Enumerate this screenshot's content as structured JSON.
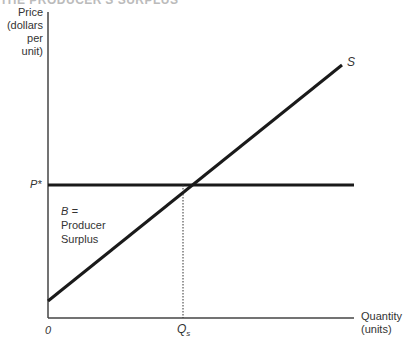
{
  "header_fragment": "THE PRODUCER'S SURPLUS",
  "axes": {
    "y_label_lines": [
      "Price",
      "(dollars",
      "per unit)"
    ],
    "x_label_lines": [
      "Quantity",
      "(units)"
    ],
    "origin_label": "0"
  },
  "labels": {
    "price_level": "P*",
    "supply_curve": "S",
    "quantity_level": "Q",
    "quantity_subscript": "s",
    "area_lines": [
      "B =",
      "Producer",
      "Surplus"
    ]
  },
  "colors": {
    "line": "#1a1a1a",
    "axis": "#444444",
    "text": "#333333"
  },
  "geometry": {
    "origin": [
      48,
      318
    ],
    "y_axis_top": 12,
    "x_axis_right": 354,
    "price_line_y": 185,
    "supply_start": [
      48,
      301
    ],
    "supply_end": [
      342,
      65
    ],
    "intersection": [
      183,
      185
    ]
  }
}
